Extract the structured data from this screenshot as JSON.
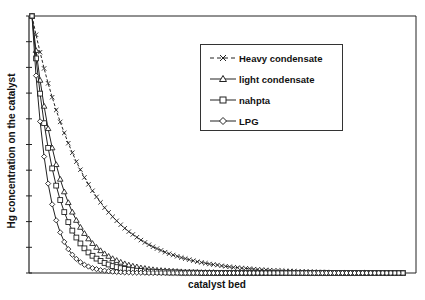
{
  "chart_data": {
    "type": "line",
    "title": "",
    "xlabel": "catalyst bed",
    "ylabel": "Hg concentration on the catalyst",
    "ylim": [
      0,
      1
    ],
    "y_ticks_count": 10,
    "x_tick_labels": [],
    "y_tick_labels": [],
    "grid": false,
    "legend_position": "upper right (inside)",
    "point_count": 93,
    "series": [
      {
        "name": "Heavy condensate",
        "marker": "x",
        "line": "dashed",
        "values": [
          1.0,
          0.927,
          0.859,
          0.796,
          0.738,
          0.684,
          0.634,
          0.588,
          0.545,
          0.505,
          0.468,
          0.433,
          0.402,
          0.372,
          0.345,
          0.32,
          0.296,
          0.275,
          0.254,
          0.236,
          0.219,
          0.203,
          0.188,
          0.174,
          0.161,
          0.15,
          0.139,
          0.128,
          0.119,
          0.11,
          0.102,
          0.095,
          0.088,
          0.081,
          0.075,
          0.07,
          0.065,
          0.06,
          0.056,
          0.052,
          0.048,
          0.044,
          0.041,
          0.038,
          0.035,
          0.033,
          0.031,
          0.028,
          0.026,
          0.024,
          0.022,
          0.021,
          0.019,
          0.018,
          0.017,
          0.015,
          0.014,
          0.013,
          0.012,
          0.011,
          0.01,
          0.01,
          0.009,
          0.008,
          0.008,
          0.007,
          0.006,
          0.006,
          0.006,
          0.005,
          0.005,
          0.004,
          0.004,
          0.004,
          0.003,
          0.003,
          0.003,
          0.003,
          0.002,
          0.002,
          0.002,
          0.002,
          0.002,
          0.002,
          0.001,
          0.001,
          0.001,
          0.001,
          0.001,
          0.001,
          0.001,
          0.001,
          0.001
        ]
      },
      {
        "name": "light condensate",
        "marker": "triangle",
        "line": "solid",
        "values": [
          1.0,
          0.866,
          0.75,
          0.649,
          0.562,
          0.487,
          0.422,
          0.365,
          0.316,
          0.274,
          0.237,
          0.205,
          0.178,
          0.154,
          0.133,
          0.115,
          0.1,
          0.087,
          0.075,
          0.065,
          0.056,
          0.049,
          0.042,
          0.036,
          0.031,
          0.027,
          0.024,
          0.02,
          0.018,
          0.015,
          0.013,
          0.011,
          0.01,
          0.009,
          0.008,
          0.007,
          0.006,
          0.005,
          0.004,
          0.004,
          0.003,
          0.003,
          0.002,
          0.002,
          0.002,
          0.002,
          0.001,
          0.001,
          0.001,
          0.001,
          0.001,
          0.001,
          0.001,
          0,
          0,
          0,
          0,
          0,
          0,
          0,
          0,
          0,
          0,
          0,
          0,
          0,
          0,
          0,
          0,
          0,
          0,
          0,
          0,
          0,
          0,
          0,
          0,
          0,
          0,
          0,
          0,
          0,
          0,
          0,
          0,
          0,
          0,
          0,
          0,
          0,
          0,
          0,
          0
        ]
      },
      {
        "name": "nahpta",
        "marker": "square",
        "line": "solid",
        "values": [
          1.0,
          0.835,
          0.698,
          0.583,
          0.487,
          0.407,
          0.34,
          0.284,
          0.237,
          0.198,
          0.165,
          0.138,
          0.115,
          0.096,
          0.08,
          0.067,
          0.056,
          0.047,
          0.039,
          0.033,
          0.027,
          0.023,
          0.019,
          0.016,
          0.013,
          0.011,
          0.009,
          0.008,
          0.006,
          0.005,
          0.005,
          0.004,
          0.003,
          0.003,
          0.002,
          0.002,
          0.002,
          0.001,
          0.001,
          0.001,
          0.001,
          0.001,
          0,
          0,
          0,
          0,
          0,
          0,
          0,
          0,
          0,
          0,
          0,
          0,
          0,
          0,
          0,
          0,
          0,
          0,
          0,
          0,
          0,
          0,
          0,
          0,
          0,
          0,
          0,
          0,
          0,
          0,
          0,
          0,
          0,
          0,
          0,
          0,
          0,
          0,
          0,
          0,
          0,
          0,
          0,
          0,
          0,
          0,
          0,
          0,
          0,
          0,
          0
        ]
      },
      {
        "name": "LPG",
        "marker": "diamond",
        "line": "solid",
        "values": [
          1.0,
          0.768,
          0.59,
          0.453,
          0.348,
          0.267,
          0.205,
          0.158,
          0.121,
          0.093,
          0.071,
          0.055,
          0.042,
          0.032,
          0.025,
          0.019,
          0.015,
          0.011,
          0.009,
          0.007,
          0.005,
          0.004,
          0.003,
          0.002,
          0.002,
          0.001,
          0.001,
          0.001,
          0.001,
          0,
          0,
          0,
          0,
          0,
          0,
          0,
          0,
          0,
          0,
          0,
          0,
          0,
          0,
          0,
          0,
          0,
          0,
          0,
          0,
          0,
          0,
          0,
          0,
          0,
          0,
          0,
          0,
          0,
          0,
          0,
          0,
          0,
          0,
          0,
          0,
          0,
          0,
          0,
          0,
          0,
          0,
          0,
          0,
          0,
          0,
          0,
          0,
          0,
          0,
          0,
          0,
          0,
          0,
          0,
          0,
          0,
          0,
          0,
          0,
          0,
          0,
          0,
          0
        ]
      }
    ]
  },
  "legend": {
    "items": [
      {
        "label": "Heavy condensate"
      },
      {
        "label": "light condensate"
      },
      {
        "label": "nahpta"
      },
      {
        "label": "LPG"
      }
    ]
  },
  "axes": {
    "xlabel": "catalyst bed",
    "ylabel": "Hg concentration on the catalyst"
  }
}
